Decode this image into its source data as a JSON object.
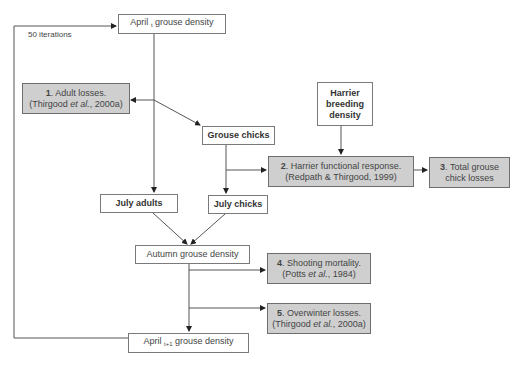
{
  "diagram": {
    "loop_label": "50 iterations",
    "nodes": {
      "april_t": {
        "text_before": "April",
        "subscript": "t",
        "text_after": "grouse density"
      },
      "adult_losses": {
        "number": "1",
        "line1": ". Adult losses.",
        "line2_pre": "(Thirgood ",
        "line2_italic": "et al.",
        "line2_post": ", 2000a)"
      },
      "harrier_breeding": {
        "line1": "Harrier",
        "line2": "breeding",
        "line3": "density"
      },
      "grouse_chicks": {
        "text": "Grouse chicks"
      },
      "harrier_functional": {
        "number": "2",
        "line1": ". Harrier functional response.",
        "line2": "(Redpath & Thirgood, 1999)"
      },
      "total_chick_losses": {
        "number": "3",
        "line1": ". Total grouse",
        "line2": "chick losses"
      },
      "july_adults": {
        "text": "July adults"
      },
      "july_chicks": {
        "text": "July chicks"
      },
      "autumn_density": {
        "text": "Autumn grouse density"
      },
      "shooting_mortality": {
        "number": "4",
        "line1": ". Shooting mortality.",
        "line2_pre": "(Potts ",
        "line2_italic": "et al.",
        "line2_post": ", 1984)"
      },
      "overwinter_losses": {
        "number": "5",
        "line1": ". Overwinter losses.",
        "line2_pre": "(Thirgood ",
        "line2_italic": "et al.",
        "line2_post": ", 2000a)"
      },
      "april_t1": {
        "text_before": "April",
        "subscript": "t+1",
        "text_after": "grouse density"
      }
    },
    "colors": {
      "gray_fill": "#cfcfcf",
      "line": "#555555",
      "border": "#7a7a7a"
    }
  }
}
